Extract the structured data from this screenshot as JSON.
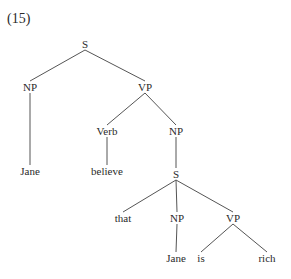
{
  "example_number": "(15)",
  "colors": {
    "line": "#555555",
    "text": "#2a2a2a",
    "background": "#ffffff"
  },
  "nodes": [
    {
      "id": "S1",
      "label": "S",
      "x": 85,
      "y": 44,
      "type": "category"
    },
    {
      "id": "NP1",
      "label": "NP",
      "x": 30,
      "y": 87,
      "type": "category"
    },
    {
      "id": "VP1",
      "label": "VP",
      "x": 145,
      "y": 87,
      "type": "category"
    },
    {
      "id": "W1",
      "label": "Jane",
      "x": 30,
      "y": 171,
      "type": "word"
    },
    {
      "id": "V1",
      "label": "Verb",
      "x": 107,
      "y": 131,
      "type": "category"
    },
    {
      "id": "W2",
      "label": "believe",
      "x": 107,
      "y": 171,
      "type": "word"
    },
    {
      "id": "NP2",
      "label": "NP",
      "x": 176,
      "y": 131,
      "type": "category"
    },
    {
      "id": "S2",
      "label": "S",
      "x": 176,
      "y": 174,
      "type": "category"
    },
    {
      "id": "W3",
      "label": "that",
      "x": 123,
      "y": 218,
      "type": "word"
    },
    {
      "id": "NP3",
      "label": "NP",
      "x": 177,
      "y": 218,
      "type": "category"
    },
    {
      "id": "VP2",
      "label": "VP",
      "x": 233,
      "y": 218,
      "type": "category"
    },
    {
      "id": "W4",
      "label": "Jane",
      "x": 176,
      "y": 258,
      "type": "word"
    },
    {
      "id": "W5",
      "label": "is",
      "x": 201,
      "y": 258,
      "type": "word"
    },
    {
      "id": "W6",
      "label": "rich",
      "x": 267,
      "y": 258,
      "type": "word"
    }
  ],
  "edges": [
    [
      "S1",
      "NP1"
    ],
    [
      "S1",
      "VP1"
    ],
    [
      "NP1",
      "W1"
    ],
    [
      "VP1",
      "V1"
    ],
    [
      "VP1",
      "NP2"
    ],
    [
      "V1",
      "W2"
    ],
    [
      "NP2",
      "S2"
    ],
    [
      "S2",
      "W3"
    ],
    [
      "S2",
      "NP3"
    ],
    [
      "S2",
      "VP2"
    ],
    [
      "NP3",
      "W4"
    ],
    [
      "VP2",
      "W5"
    ],
    [
      "VP2",
      "W6"
    ]
  ]
}
